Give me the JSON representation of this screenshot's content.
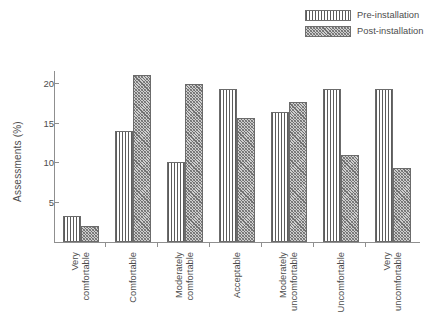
{
  "chart_data": {
    "type": "bar",
    "title": "",
    "xlabel": "",
    "ylabel": "Assessments (%)",
    "ylim": [
      0,
      21.5
    ],
    "yticks": [
      5,
      10,
      15,
      20
    ],
    "ytick_labels": [
      "5",
      "10",
      "15",
      "20"
    ],
    "grid": false,
    "legend_position": "top-right",
    "categories": [
      "Very\ncomfortable",
      "Comfortable",
      "Moderately\ncomfortable",
      "Acceptable",
      "Moderately\nuncomfortable",
      "Uncomfortable",
      "Very\nuncomfortable"
    ],
    "series": [
      {
        "name": "Pre-installation",
        "pattern": "vertical-hatch",
        "values": [
          3.3,
          14.0,
          10.0,
          19.2,
          16.3,
          19.2,
          19.2
        ]
      },
      {
        "name": "Post-installation",
        "pattern": "dot-hatch",
        "values": [
          2.0,
          21.0,
          19.9,
          15.6,
          17.6,
          11.0,
          9.3
        ]
      }
    ]
  },
  "legend": {
    "items": [
      {
        "label": "Pre-installation",
        "swatch": "vertical-hatch-swatch"
      },
      {
        "label": "Post-installation",
        "swatch": "dot-hatch-swatch"
      }
    ]
  },
  "axis": {
    "y_title": "Assessments (%)"
  },
  "colors": {
    "axis": "#8f8f8f",
    "text": "#4d4d4d",
    "bar_outline": "#6b6b6b",
    "pre_hatch": "#5c5c5c",
    "post_fill": "#cfcfcf"
  }
}
